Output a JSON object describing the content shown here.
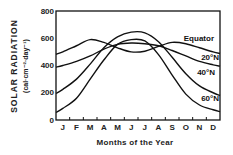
{
  "chart_data": {
    "type": "line",
    "title": "",
    "xlabel": "Months of the Year",
    "ylabel": "SOLAR RADIATION",
    "ylabel_units": "(cal·cm⁻²·day⁻¹)",
    "ylim": [
      0,
      800
    ],
    "yticks": [
      0,
      200,
      400,
      600,
      800
    ],
    "categories": [
      "J",
      "F",
      "M",
      "A",
      "M",
      "J",
      "J",
      "A",
      "S",
      "O",
      "N",
      "D"
    ],
    "grid": false,
    "legend_position": "inline-right",
    "series": [
      {
        "name": "Equator",
        "values": [
          500,
          545,
          590,
          570,
          530,
          500,
          505,
          540,
          570,
          560,
          530,
          500
        ]
      },
      {
        "name": "20°N",
        "values": [
          400,
          430,
          470,
          520,
          555,
          565,
          560,
          545,
          510,
          470,
          430,
          405
        ]
      },
      {
        "name": "40°N",
        "values": [
          225,
          300,
          410,
          530,
          610,
          645,
          640,
          575,
          460,
          340,
          250,
          200
        ]
      },
      {
        "name": "60°N",
        "values": [
          85,
          160,
          300,
          440,
          555,
          590,
          580,
          480,
          330,
          190,
          110,
          75
        ]
      }
    ]
  },
  "labels": {
    "y_title": "SOLAR RADIATION",
    "y_units": "(cal·cm⁻²·day⁻¹)",
    "x_title": "Months of the Year",
    "series_equator": "Equator",
    "series_20n": "20°N",
    "series_40n": "40°N",
    "series_60n": "60°N",
    "y0": "0",
    "y200": "200",
    "y400": "400",
    "y600": "600",
    "y800": "800",
    "m1": "J",
    "m2": "F",
    "m3": "M",
    "m4": "A",
    "m5": "M",
    "m6": "J",
    "m7": "J",
    "m8": "A",
    "m9": "S",
    "m10": "O",
    "m11": "N",
    "m12": "D"
  }
}
